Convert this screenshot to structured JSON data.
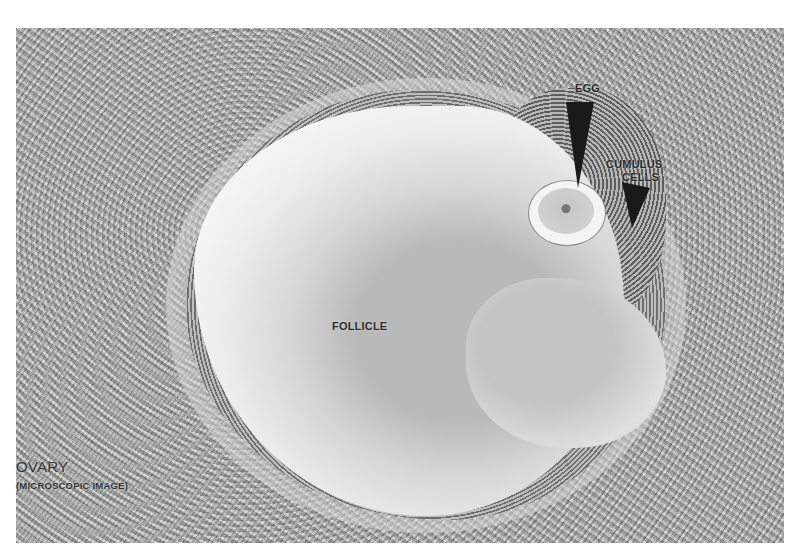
{
  "image": {
    "title": "OVARY",
    "subtitle": "(MICROSCOPIC IMAGE)"
  },
  "labels": {
    "egg": "EGG",
    "cumulus_line1": "CUMULUS",
    "cumulus_line2": "CELLS",
    "follicle": "FOLLICLE"
  },
  "colors": {
    "background": "#fefefe",
    "tissue": "#a4a4a4",
    "follicle_fluid": "#f2f2f2",
    "label_text": "#2c2c2c",
    "arrow": "#1a1a1a"
  }
}
